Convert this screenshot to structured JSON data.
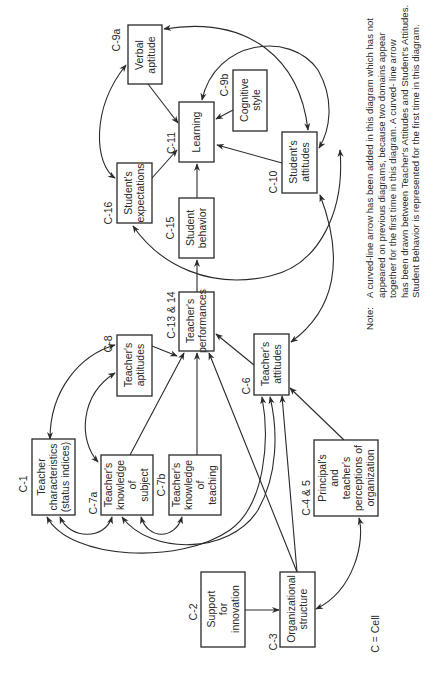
{
  "diagram": {
    "orientation": "rotated -90deg (text reads bottom-to-top)",
    "nodes": [
      {
        "id": "c9a",
        "cell": "C-9a",
        "lines": [
          "Verbal",
          "aptitude"
        ]
      },
      {
        "id": "c11",
        "cell": "C-11",
        "lines": [
          "Learning"
        ]
      },
      {
        "id": "c9b",
        "cell": "C-9b",
        "lines": [
          "Cognitive",
          "style"
        ]
      },
      {
        "id": "c16",
        "cell": "C-16",
        "lines": [
          "Student's",
          "expectations"
        ]
      },
      {
        "id": "c15",
        "cell": "C-15",
        "lines": [
          "Student",
          "behavior"
        ]
      },
      {
        "id": "c10",
        "cell": "C-10",
        "lines": [
          "Student's",
          "attitudes"
        ]
      },
      {
        "id": "c1314",
        "cell": "C-13 & 14",
        "lines": [
          "Teacher's",
          "performances"
        ]
      },
      {
        "id": "c8",
        "cell": "C-8",
        "lines": [
          "Teacher's",
          "aptitudes"
        ]
      },
      {
        "id": "c6",
        "cell": "C-6",
        "lines": [
          "Teacher's",
          "attitudes"
        ]
      },
      {
        "id": "c1",
        "cell": "C-1",
        "lines": [
          "Teacher",
          "characteristics",
          "(status indices)"
        ]
      },
      {
        "id": "c7a",
        "cell": "C-7a",
        "lines": [
          "Teacher's",
          "knowledge",
          "of",
          "subject"
        ]
      },
      {
        "id": "c7b",
        "cell": "C-7b",
        "lines": [
          "Teacher's",
          "knowledge",
          "of",
          "teaching"
        ]
      },
      {
        "id": "c45",
        "cell": "C-4 & 5",
        "lines": [
          "Principal's",
          "and",
          "teacher's",
          "perceptions of",
          "organization"
        ]
      },
      {
        "id": "c2",
        "cell": "C-2",
        "lines": [
          "Support",
          "for",
          "innovation"
        ]
      },
      {
        "id": "c3",
        "cell": "C-3",
        "lines": [
          "Organizational",
          "structure"
        ]
      }
    ],
    "edges": [
      {
        "from": "c9a",
        "to": "c11",
        "type": "arrow"
      },
      {
        "from": "c9b",
        "to": "c11",
        "type": "arrow"
      },
      {
        "from": "c16",
        "to": "c11",
        "type": "arrow"
      },
      {
        "from": "c15",
        "to": "c11",
        "type": "arrow"
      },
      {
        "from": "c10",
        "to": "c11",
        "type": "arrow"
      },
      {
        "from": "c1314",
        "to": "c15",
        "type": "arrow"
      },
      {
        "from": "c8",
        "to": "c1314",
        "type": "arrow"
      },
      {
        "from": "c6",
        "to": "c1314",
        "type": "arrow"
      },
      {
        "from": "c7a",
        "to": "c1314",
        "type": "arrow"
      },
      {
        "from": "c7b",
        "to": "c1314",
        "type": "arrow"
      },
      {
        "from": "c3",
        "to": "c1314",
        "type": "arrow"
      },
      {
        "from": "c3",
        "to": "c6",
        "type": "arrow"
      },
      {
        "from": "c45",
        "to": "c6",
        "type": "arrow"
      },
      {
        "from": "c2",
        "to": "c3",
        "type": "arrow"
      },
      {
        "from": "c3",
        "to": "c45",
        "type": "curved-bidirectional"
      },
      {
        "from": "c9a",
        "to": "c16",
        "type": "curved-bidirectional"
      },
      {
        "from": "c9a",
        "to": "c10",
        "type": "curved-bidirectional"
      },
      {
        "from": "c9b",
        "to": "c10",
        "type": "curved-bidirectional"
      },
      {
        "from": "c10",
        "to": "c16",
        "type": "curved-bidirectional"
      },
      {
        "from": "c6",
        "to": "c10",
        "type": "curved-bidirectional"
      },
      {
        "from": "c1",
        "to": "c8",
        "type": "curved-bidirectional"
      },
      {
        "from": "c7a",
        "to": "c8",
        "type": "curved-bidirectional"
      },
      {
        "from": "c1",
        "to": "c7a",
        "type": "curved-bidirectional"
      },
      {
        "from": "c7a",
        "to": "c7b",
        "type": "curved-bidirectional"
      },
      {
        "from": "c1",
        "to": "c6",
        "type": "curved-bidirectional"
      },
      {
        "from": "c7a",
        "to": "c6",
        "type": "curved-bidirectional"
      }
    ],
    "legend": "C = Cell",
    "note": {
      "label": "Note:",
      "lines": [
        "A curved-line arrow has been  added in this diagram which  has not",
        "appeared on previous  diagrams,  because two domains  appear",
        "together for the first  time in this diagram.  A curved- line arrow",
        "has been drawn between Teacher's Attitudes  and  Student's Attitudes.",
        "Student  Behavior is represented for the  first time in this diagram."
      ]
    }
  }
}
